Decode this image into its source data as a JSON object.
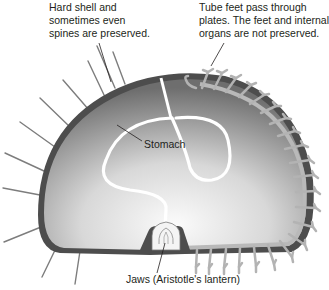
{
  "labels": {
    "shell": "Hard shell and\nsometimes even\nspines are preserved.",
    "tube_feet": "Tube feet pass through\nplates. The feet and internal\norgans are not preserved.",
    "stomach": "Stomach",
    "jaws": "Jaws (Aristotle's lantern)"
  },
  "colors": {
    "shell_dark": "#4a4a4a",
    "body_gray": "#8a8a8a",
    "body_light": "#efefef",
    "tube_feet": "#b8b8b8",
    "spine": "#7a7a7a",
    "text": "#231f20"
  }
}
